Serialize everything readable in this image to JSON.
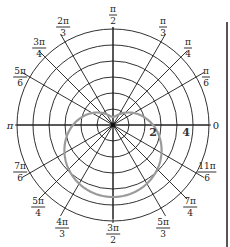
{
  "chart_data": {
    "type": "line",
    "subtype": "polar",
    "title": "",
    "grid": true,
    "r_max": 6,
    "grid_circles": [
      1,
      2,
      3,
      4,
      5,
      6
    ],
    "radial_tick_labels": [
      {
        "value": 2,
        "label": "2"
      },
      {
        "value": 4,
        "label": "4"
      }
    ],
    "angle_labels": [
      {
        "angle": "0",
        "num": "0",
        "den": ""
      },
      {
        "angle": "pi/6",
        "num": "π",
        "den": "6"
      },
      {
        "angle": "pi/4",
        "num": "π",
        "den": "4"
      },
      {
        "angle": "pi/3",
        "num": "π",
        "den": "3"
      },
      {
        "angle": "pi/2",
        "num": "π",
        "den": "2"
      },
      {
        "angle": "2pi/3",
        "num": "2π",
        "den": "3"
      },
      {
        "angle": "3pi/4",
        "num": "3π",
        "den": "4"
      },
      {
        "angle": "5pi/6",
        "num": "5π",
        "den": "6"
      },
      {
        "angle": "pi",
        "num": "π",
        "den": ""
      },
      {
        "angle": "7pi/6",
        "num": "7π",
        "den": "6"
      },
      {
        "angle": "5pi/4",
        "num": "5π",
        "den": "4"
      },
      {
        "angle": "4pi/3",
        "num": "4π",
        "den": "3"
      },
      {
        "angle": "3pi/2",
        "num": "3π",
        "den": "2"
      },
      {
        "angle": "5pi/3",
        "num": "5π",
        "den": "3"
      },
      {
        "angle": "7pi/4",
        "num": "7π",
        "den": "4"
      },
      {
        "angle": "11pi/6",
        "num": "11π",
        "den": "6"
      }
    ],
    "series": [
      {
        "name": "curve",
        "color": "#9a9a9a",
        "equation": "r = 2.5 - 2 sin(theta)",
        "description": "dimpled limaçon below the pole; top ≈ 0.5 above origin, bottom ≈ 4.5 below",
        "a": 2.5,
        "b": -2
      }
    ],
    "colors": {
      "grid": "#1a1a1a",
      "curve": "#9a9a9a",
      "frame_bar": "#555555"
    }
  }
}
